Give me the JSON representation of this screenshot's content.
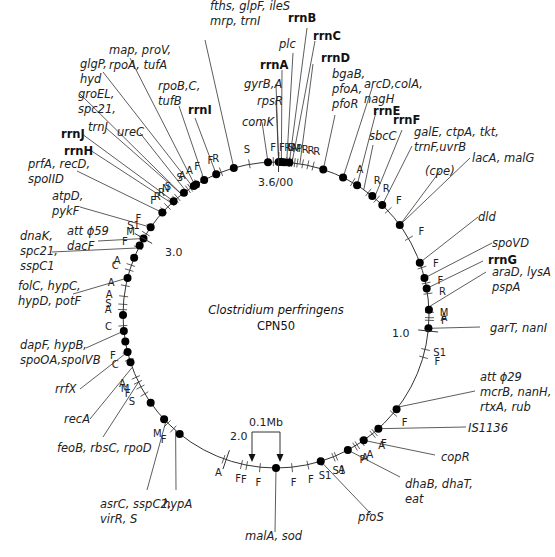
{
  "diagram": {
    "title": "Clostridium perfringens",
    "subtitle": "CPN50",
    "center": [
      276,
      315
    ],
    "radius": 153,
    "colors": {
      "line": "#333333",
      "dot": "#000000",
      "text": "#222222"
    },
    "scale_bar": {
      "label": "0.1Mb",
      "x1": 252,
      "x2": 280,
      "top": 432,
      "tip": 462
    },
    "scale_labels": [
      {
        "text": "3.6/00",
        "angle": 1,
        "x": 258,
        "y": 186
      },
      {
        "text": "1.0",
        "angle": 96,
        "x": 392,
        "y": 337
      },
      {
        "text": "2.0",
        "angle": 199,
        "x": 230,
        "y": 440
      },
      {
        "text": "3.0",
        "angle": 300,
        "x": 165,
        "y": 256
      }
    ],
    "genes": [
      {
        "text": [
          "fths, glpF, ileS",
          "mrp, trnI"
        ],
        "angle": 344,
        "lx": 205,
        "ly": 40,
        "ax": 210,
        "ay": 10,
        "bold": false
      },
      {
        "text": [
          "map, proV,",
          "rpoA, tufA"
        ],
        "angle": 328,
        "lx": 130,
        "ly": 58,
        "ax": 109,
        "ay": 54,
        "bold": false
      },
      {
        "text": [
          "glgP,",
          "hyd"
        ],
        "angle": 327,
        "lx": 103,
        "ly": 72,
        "ax": 80,
        "ay": 68,
        "bold": false
      },
      {
        "text": [
          "rpoB,C,",
          "tufB"
        ],
        "angle": 332,
        "lx": 179,
        "ly": 106,
        "ax": 158,
        "ay": 90,
        "bold": false
      },
      {
        "text": [
          "rrnI"
        ],
        "angle": 337,
        "lx": 195,
        "ly": 118,
        "ax": 188,
        "ay": 114,
        "bold": true
      },
      {
        "text": [
          "groEL,",
          "spc21,"
        ],
        "angle": 322,
        "lx": 80,
        "ly": 94,
        "ax": 78,
        "ay": 98,
        "bold": false
      },
      {
        "text": [
          "trnJ"
        ],
        "angle": 322,
        "lx": 106,
        "ly": 128,
        "ax": 88,
        "ay": 131,
        "bold": false
      },
      {
        "text": [
          "ureC"
        ],
        "angle": 324,
        "lx": 140,
        "ly": 133,
        "ax": 117,
        "ay": 136,
        "bold": false
      },
      {
        "text": [
          "rrnJ"
        ],
        "angle": 318,
        "lx": 82,
        "ly": 134,
        "ax": 61,
        "ay": 138,
        "bold": true
      },
      {
        "text": [
          "rrnH"
        ],
        "angle": 317,
        "lx": 90,
        "ly": 150,
        "ax": 64,
        "ay": 155,
        "bold": true
      },
      {
        "text": [
          "prfA, recD,",
          "spoIID"
        ],
        "angle": 312,
        "lx": 77,
        "ly": 171,
        "ax": 28,
        "ay": 168,
        "bold": false
      },
      {
        "text": [
          "atpD,",
          "pykF"
        ],
        "angle": 305,
        "lx": 80,
        "ly": 207,
        "ax": 52,
        "ay": 200,
        "bold": false
      },
      {
        "text": [
          "att ϕ59",
          "dacF"
        ],
        "angle": 300,
        "lx": 98,
        "ly": 241,
        "ax": 67,
        "ay": 235,
        "bold": false
      },
      {
        "text": [
          "dnaK,",
          "spc21,",
          "sspC1"
        ],
        "angle": 296,
        "lx": 52,
        "ly": 252,
        "ax": 20,
        "ay": 240,
        "bold": false
      },
      {
        "text": [
          "folC, hypC,",
          "hypD, potF"
        ],
        "angle": 284,
        "lx": 73,
        "ly": 294,
        "ax": 18,
        "ay": 290,
        "bold": false
      },
      {
        "text": [
          "dapF, hypB,",
          "spoOA,spoIVB"
        ],
        "angle": 264,
        "lx": 86,
        "ly": 348,
        "ax": 20,
        "ay": 349,
        "bold": false
      },
      {
        "text": [
          "rrfX"
        ],
        "angle": 256,
        "lx": 80,
        "ly": 389,
        "ax": 55,
        "ay": 393,
        "bold": false
      },
      {
        "text": [
          "recA"
        ],
        "angle": 250,
        "lx": 90,
        "ly": 419,
        "ax": 64,
        "ay": 423,
        "bold": false
      },
      {
        "text": [
          "feoB, rbsC, rpoD"
        ],
        "angle": 244,
        "lx": 103,
        "ly": 437,
        "ax": 57,
        "ay": 452,
        "bold": false
      },
      {
        "text": [
          "asrC, sspC2,",
          "virR, S"
        ],
        "angle": 226,
        "lx": 147,
        "ly": 490,
        "ax": 100,
        "ay": 508,
        "bold": false
      },
      {
        "text": [
          "hypA"
        ],
        "angle": 221,
        "lx": 176,
        "ly": 490,
        "ax": 163,
        "ay": 508,
        "bold": false
      },
      {
        "text": [
          "malA, sod"
        ],
        "angle": 180,
        "lx": 275,
        "ly": 532,
        "ax": 245,
        "ay": 540,
        "bold": false
      },
      {
        "text": [
          "pfoS"
        ],
        "angle": 163,
        "lx": 372,
        "ly": 515,
        "ax": 358,
        "ay": 521,
        "bold": false
      },
      {
        "text": [
          "dhaB, dhaT,",
          "eat"
        ],
        "angle": 152,
        "lx": 400,
        "ly": 477,
        "ax": 405,
        "ay": 488,
        "bold": false
      },
      {
        "text": [
          "copR"
        ],
        "angle": 145,
        "lx": 435,
        "ly": 455,
        "ax": 441,
        "ay": 461,
        "bold": false
      },
      {
        "text": [
          "IS1136"
        ],
        "angle": 138,
        "lx": 466,
        "ly": 427,
        "ax": 468,
        "ay": 432,
        "bold": false
      },
      {
        "text": [
          "att ϕ29",
          "mcrB, nanH,",
          "rtxA, rub"
        ],
        "angle": 127,
        "lx": 475,
        "ly": 391,
        "ax": 480,
        "ay": 381,
        "bold": false
      },
      {
        "text": [
          "garT, nanI"
        ],
        "angle": 95,
        "lx": 480,
        "ly": 327,
        "ax": 490,
        "ay": 332,
        "bold": false
      },
      {
        "text": [
          "araD, lysA",
          "pspA"
        ],
        "angle": 87,
        "lx": 486,
        "ly": 272,
        "ax": 492,
        "ay": 276,
        "bold": false
      },
      {
        "text": [
          "rrnG"
        ],
        "angle": 80,
        "lx": 483,
        "ly": 261,
        "ax": 488,
        "ay": 264,
        "bold": true
      },
      {
        "text": [
          "spoVD"
        ],
        "angle": 76,
        "lx": 492,
        "ly": 243,
        "ax": 492,
        "ay": 247,
        "bold": false
      },
      {
        "text": [
          "dld"
        ],
        "angle": 70,
        "lx": 478,
        "ly": 217,
        "ax": 478,
        "ay": 221,
        "bold": false
      },
      {
        "text": [
          "lacA, malG"
        ],
        "angle": 54,
        "lx": 470,
        "ly": 158,
        "ax": 472,
        "ay": 162,
        "bold": false
      },
      {
        "text": [
          "(cpe)"
        ],
        "angle": 54,
        "lx": 440,
        "ly": 171,
        "ax": 425,
        "ay": 175,
        "bold": false
      },
      {
        "text": [
          "galE, ctpA, tkt,",
          "trnF,uvrB"
        ],
        "angle": 44,
        "lx": 412,
        "ly": 146,
        "ax": 414,
        "ay": 136,
        "bold": false
      },
      {
        "text": [
          "rrnF"
        ],
        "angle": 40,
        "lx": 402,
        "ly": 130,
        "ax": 393,
        "ay": 124,
        "bold": true
      },
      {
        "text": [
          "sbcC"
        ],
        "angle": 35,
        "lx": 373,
        "ly": 145,
        "ax": 369,
        "ay": 140,
        "bold": false
      },
      {
        "text": [
          "rrnE"
        ],
        "angle": 32,
        "lx": 376,
        "ly": 112,
        "ax": 373,
        "ay": 115,
        "bold": true
      },
      {
        "text": [
          "arcD,colA,",
          "nagH"
        ],
        "angle": 26,
        "lx": 372,
        "ly": 88,
        "ax": 364,
        "ay": 88,
        "bold": false
      },
      {
        "text": [
          "bgaB,",
          "pfoA,",
          "pfoR"
        ],
        "angle": 18,
        "lx": 335,
        "ly": 115,
        "ax": 332,
        "ay": 78,
        "bold": false
      },
      {
        "text": [
          "rrnD"
        ],
        "angle": 9,
        "lx": 313,
        "ly": 64,
        "ax": 321,
        "ay": 62,
        "bold": true
      },
      {
        "text": [
          "rrnC"
        ],
        "angle": 6,
        "lx": 315,
        "ly": 41,
        "ax": 313,
        "ay": 40,
        "bold": true
      },
      {
        "text": [
          "rrnB"
        ],
        "angle": 5,
        "lx": 307,
        "ly": 28,
        "ax": 288,
        "ay": 22,
        "bold": true
      },
      {
        "text": [
          "plc"
        ],
        "angle": 4,
        "lx": 293,
        "ly": 53,
        "ax": 279,
        "ay": 48,
        "bold": false
      },
      {
        "text": [
          "rrnA"
        ],
        "angle": 2,
        "lx": 282,
        "ly": 70,
        "ax": 260,
        "ay": 69,
        "bold": true
      },
      {
        "text": [
          "gyrB,A"
        ],
        "angle": 1,
        "lx": 276,
        "ly": 84,
        "ax": 244,
        "ay": 88,
        "bold": false
      },
      {
        "text": [
          "rpsR"
        ],
        "angle": 1,
        "lx": 276,
        "ly": 100,
        "ax": 257,
        "ay": 105,
        "bold": false
      },
      {
        "text": [
          "comK"
        ],
        "angle": 357,
        "lx": 262,
        "ly": 122,
        "ax": 242,
        "ay": 126,
        "bold": false
      }
    ],
    "dots": [
      344,
      327.5,
      328.5,
      332,
      337,
      323,
      318,
      312,
      305,
      300,
      297,
      292,
      284,
      270,
      264,
      260,
      256,
      252,
      235,
      227,
      219,
      180,
      163,
      152,
      145,
      138,
      128,
      95,
      88,
      80,
      76,
      70,
      54,
      44,
      39,
      32,
      26,
      18,
      357,
      1,
      2,
      3,
      5
    ],
    "markers": [
      {
        "t": "S",
        "angle": 350
      },
      {
        "t": "R",
        "angle": 339
      },
      {
        "t": "F",
        "angle": 337
      },
      {
        "t": "F",
        "angle": 332
      },
      {
        "t": "A",
        "angle": 329
      },
      {
        "t": "A",
        "angle": 326
      },
      {
        "t": "S",
        "angle": 325
      },
      {
        "t": "S",
        "angle": 320
      },
      {
        "t": "N",
        "angle": 319
      },
      {
        "t": "R",
        "angle": 317
      },
      {
        "t": "R",
        "angle": 315
      },
      {
        "t": "F",
        "angle": 313
      },
      {
        "t": "F",
        "angle": 305
      },
      {
        "t": "S1",
        "angle": 302
      },
      {
        "t": "M",
        "angle": 300
      },
      {
        "t": "F",
        "angle": 296
      },
      {
        "t": "A",
        "angle": 289
      },
      {
        "t": "C",
        "angle": 287
      },
      {
        "t": "A",
        "angle": 281
      },
      {
        "t": "A",
        "angle": 277
      },
      {
        "t": "S",
        "angle": 274
      },
      {
        "t": "A",
        "angle": 272
      },
      {
        "t": "C",
        "angle": 266
      },
      {
        "t": "F",
        "angle": 256
      },
      {
        "t": "C",
        "angle": 253
      },
      {
        "t": "A",
        "angle": 246
      },
      {
        "t": "M",
        "angle": 244
      },
      {
        "t": "F",
        "angle": 242
      },
      {
        "t": "S",
        "angle": 239
      },
      {
        "t": "M",
        "angle": 225
      },
      {
        "t": "F",
        "angle": 222
      },
      {
        "t": "A",
        "angle": 200
      },
      {
        "t": "F",
        "angle": 193
      },
      {
        "t": "F",
        "angle": 191
      },
      {
        "t": "F",
        "angle": 186
      },
      {
        "t": "F",
        "angle": 174
      },
      {
        "t": "F",
        "angle": 168
      },
      {
        "t": "S1",
        "angle": 163
      },
      {
        "t": "S1",
        "angle": 158
      },
      {
        "t": "A",
        "angle": 157
      },
      {
        "t": "P",
        "angle": 149
      },
      {
        "t": "A",
        "angle": 148
      },
      {
        "t": "A",
        "angle": 146
      },
      {
        "t": "A",
        "angle": 141
      },
      {
        "t": "F",
        "angle": 140
      },
      {
        "t": "F",
        "angle": 130
      },
      {
        "t": "S1",
        "angle": 103
      },
      {
        "t": "F",
        "angle": 106
      },
      {
        "t": "M",
        "angle": 89
      },
      {
        "t": "A",
        "angle": 91
      },
      {
        "t": "F",
        "angle": 92
      },
      {
        "t": "R",
        "angle": 82
      },
      {
        "t": "F",
        "angle": 78
      },
      {
        "t": "F",
        "angle": 72
      },
      {
        "t": "F",
        "angle": 60
      },
      {
        "t": "F",
        "angle": 47
      },
      {
        "t": "R",
        "angle": 41
      },
      {
        "t": "R",
        "angle": 37
      },
      {
        "t": "A",
        "angle": 30
      },
      {
        "t": "R",
        "angle": 14
      },
      {
        "t": "R",
        "angle": 12
      },
      {
        "t": "R",
        "angle": 10
      },
      {
        "t": "P",
        "angle": 8
      },
      {
        "t": "M",
        "angle": 7
      },
      {
        "t": "A",
        "angle": 6
      },
      {
        "t": "C",
        "angle": 5
      },
      {
        "t": "S",
        "angle": 5
      },
      {
        "t": "R",
        "angle": 4
      },
      {
        "t": "F",
        "angle": 2
      },
      {
        "t": "F",
        "angle": 359
      }
    ]
  }
}
